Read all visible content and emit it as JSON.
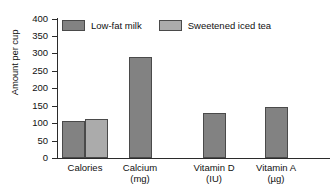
{
  "chart_data": {
    "type": "bar",
    "title": "",
    "xlabel": "",
    "ylabel": "Amount per cup",
    "ylim": [
      0,
      400
    ],
    "yticks": [
      0,
      50,
      100,
      150,
      200,
      250,
      300,
      350,
      400
    ],
    "grid": false,
    "legend_position": "top-left",
    "categories": [
      "Calories",
      "Calcium",
      "Vitamin D",
      "Vitamin A"
    ],
    "category_units": [
      "",
      "(mg)",
      "(IU)",
      "(µg)"
    ],
    "series": [
      {
        "name": "Low-fat milk",
        "color": "#828282",
        "values": [
          105,
          290,
          128,
          147
        ]
      },
      {
        "name": "Sweetened iced tea",
        "color": "#ababab",
        "values": [
          112,
          null,
          null,
          null
        ]
      }
    ]
  },
  "legend": {
    "entries": [
      {
        "label": "Low-fat milk"
      },
      {
        "label": "Sweetened iced tea"
      }
    ]
  }
}
